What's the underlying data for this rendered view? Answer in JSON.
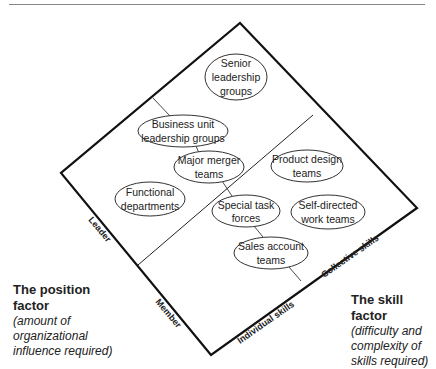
{
  "diagram": {
    "ellipses": [
      {
        "id": "senior-leadership-groups",
        "lines": [
          "Senior",
          "leadership",
          "groups"
        ]
      },
      {
        "id": "business-unit-leadership-groups",
        "lines": [
          "Business unit",
          "leadership groups"
        ]
      },
      {
        "id": "major-merger-teams",
        "lines": [
          "Major merger",
          "teams"
        ]
      },
      {
        "id": "functional-departments",
        "lines": [
          "Functional",
          "departments"
        ]
      },
      {
        "id": "product-design-teams",
        "lines": [
          "Product design",
          "teams"
        ]
      },
      {
        "id": "special-task-forces",
        "lines": [
          "Special task",
          "forces"
        ]
      },
      {
        "id": "self-directed-work-teams",
        "lines": [
          "Self-directed",
          "work teams"
        ]
      },
      {
        "id": "sales-account-teams",
        "lines": [
          "Sales account",
          "teams"
        ]
      }
    ],
    "axis_labels": {
      "leader": "Leader",
      "member": "Member",
      "individual_skills": "Individual skills",
      "collective_skills": "Collective skills"
    }
  },
  "position_factor": {
    "title_line1": "The position",
    "title_line2": "factor",
    "desc_line1": "(amount of",
    "desc_line2": "organizational",
    "desc_line3": "influence required)"
  },
  "skill_factor": {
    "title": "The skill factor",
    "desc_line1": "(difficulty and",
    "desc_line2": "complexity of",
    "desc_line3": "skills required)"
  }
}
